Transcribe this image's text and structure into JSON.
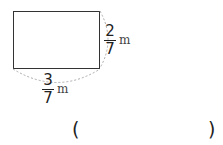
{
  "figure": {
    "shape": "rectangle",
    "height_label": {
      "numerator": "2",
      "denominator": "7",
      "unit": "m"
    },
    "width_label": {
      "numerator": "3",
      "denominator": "7",
      "unit": "m"
    }
  },
  "answer": {
    "open": "(",
    "close": ")",
    "value": ""
  }
}
